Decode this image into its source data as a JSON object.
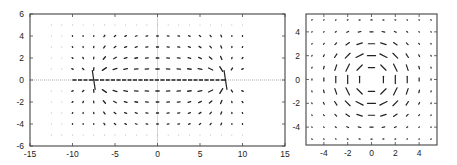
{
  "chart_data": [
    {
      "type": "quiver",
      "title": "",
      "xlabel": "",
      "ylabel": "",
      "xlim": [
        -15,
        15
      ],
      "ylim": [
        -6,
        6
      ],
      "x_ticks": [
        -15,
        -10,
        -5,
        0,
        5,
        10,
        15
      ],
      "y_ticks": [
        -6,
        -4,
        -2,
        0,
        2,
        4,
        6
      ],
      "x_tick_labels": [
        "-15",
        "-10",
        "-5",
        "0",
        "5",
        "10",
        "15"
      ],
      "y_tick_labels": [
        "-6",
        "-4",
        "-2",
        "0",
        "2",
        "4",
        "6"
      ],
      "grid": false,
      "reference_lines": [
        {
          "orientation": "horizontal",
          "value": 0,
          "style": "dotted"
        },
        {
          "orientation": "vertical",
          "value": 0,
          "style": "solid-light"
        }
      ],
      "description": "Vector field with concentrated horizontal flow along y=0 between singular points near x=-7.5 and x=8; arrows diverge/converge around these points and fade toward the edges.",
      "field": {
        "kind": "source-sink-pair",
        "singularities": [
          {
            "x": -7.5,
            "y": 0
          },
          {
            "x": 8,
            "y": 0
          }
        ],
        "grid_x_start": -12.5,
        "grid_x_step": 1.25,
        "grid_x_count": 19,
        "grid_y_values": [
          5,
          4,
          3,
          2,
          1,
          -1,
          -2,
          -3,
          -4,
          -5
        ]
      }
    },
    {
      "type": "quiver",
      "title": "",
      "xlabel": "",
      "ylabel": "",
      "xlim": [
        -5.5,
        5.5
      ],
      "ylim": [
        -5.5,
        5.5
      ],
      "x_ticks": [
        -4,
        -2,
        0,
        2,
        4
      ],
      "y_ticks": [
        -4,
        -2,
        0,
        2,
        4
      ],
      "x_tick_labels": [
        "-4",
        "-2",
        "0",
        "2",
        "4"
      ],
      "y_tick_labels": [
        "-4",
        "-2",
        "0",
        "2",
        "4"
      ],
      "grid": false,
      "description": "Rotational (vortex) vector field circulating around a center near the origin; arrow magnitudes peak on a ring of radius about 2 and decay outward.",
      "field": {
        "kind": "vortex",
        "center": {
          "x": 0,
          "y": 0
        },
        "peak_radius": 2,
        "grid_start": -5,
        "grid_step": 1,
        "grid_count": 11
      }
    }
  ]
}
